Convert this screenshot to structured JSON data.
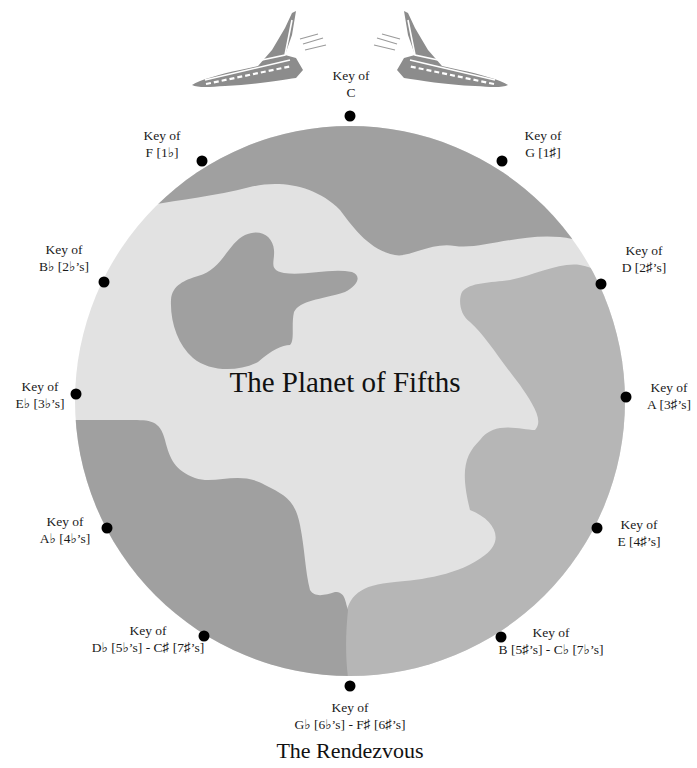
{
  "title": "The Planet of Fifths",
  "caption": "The Rendezvous",
  "colors": {
    "background": "#ffffff",
    "planet_dark": "#a0a0a0",
    "planet_mid": "#b6b6b6",
    "planet_light": "#e2e2e2",
    "ship": "#8c8c8c",
    "dot": "#000000"
  },
  "keys": [
    {
      "line1": "Key of",
      "line2": "C"
    },
    {
      "line1": "Key of",
      "line2": "G [1♯]"
    },
    {
      "line1": "Key of",
      "line2": "D [2♯’s]"
    },
    {
      "line1": "Key of",
      "line2": "A [3♯’s]"
    },
    {
      "line1": "Key of",
      "line2": "E [4♯’s]"
    },
    {
      "line1": "Key of",
      "line2": "B [5♯’s] - C♭ [7♭’s]"
    },
    {
      "line1": "Key of",
      "line2": "G♭ [6♭’s] - F♯ [6♯’s]"
    },
    {
      "line1": "Key of",
      "line2": "D♭ [5♭’s] - C♯ [7♯’s]"
    },
    {
      "line1": "Key of",
      "line2": "A♭ [4♭’s]"
    },
    {
      "line1": "Key of",
      "line2": "E♭ [3♭’s]"
    },
    {
      "line1": "Key of",
      "line2": "B♭ [2♭’s]"
    },
    {
      "line1": "Key of",
      "line2": "F [1♭]"
    }
  ],
  "icons": {
    "left_ship": "space-shuttle-icon",
    "right_ship": "space-shuttle-icon"
  }
}
